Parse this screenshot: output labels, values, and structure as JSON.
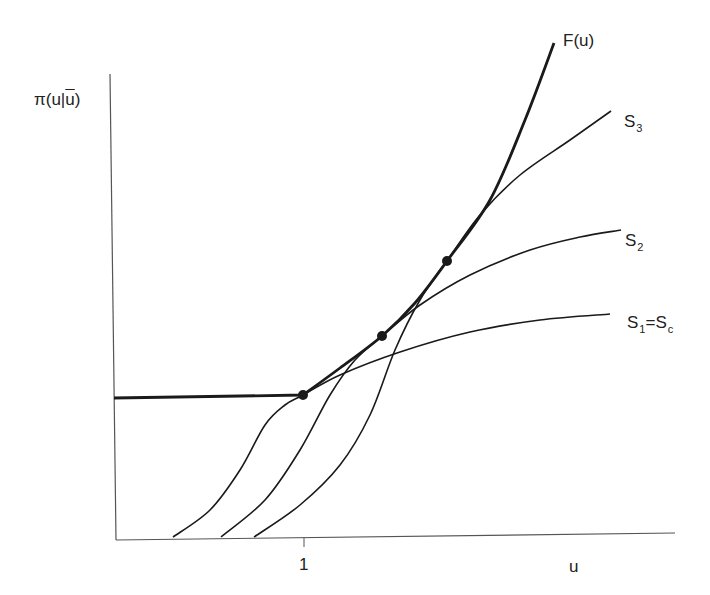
{
  "chart_data": {
    "type": "line",
    "title": "",
    "xlabel": "u",
    "ylabel": "π(u|ū)",
    "x_ticks": [
      {
        "value": 1,
        "label": "1"
      }
    ],
    "grid": false,
    "legend": "inline labels at curve ends",
    "series": [
      {
        "name": "F(u)",
        "label": "F(u)",
        "style": "thick",
        "description": "Upper envelope: flat segment for u<1, then convex increasing, tangent to S1, S2, S3 at marked points",
        "points": [
          [
            114,
            398
          ],
          [
            303,
            395
          ],
          [
            340,
            368
          ],
          [
            382,
            336
          ],
          [
            415,
            303
          ],
          [
            447,
            261
          ],
          [
            490,
            200
          ],
          [
            525,
            120
          ],
          [
            554,
            43
          ]
        ]
      },
      {
        "name": "S3",
        "label_main": "S",
        "label_sub": "3",
        "style": "thin",
        "description": "Sigmoid curve starting near u≈0.72, tangent to F at third point",
        "points": [
          [
            254,
            537
          ],
          [
            300,
            505
          ],
          [
            340,
            465
          ],
          [
            370,
            415
          ],
          [
            395,
            350
          ],
          [
            420,
            300
          ],
          [
            447,
            261
          ],
          [
            480,
            215
          ],
          [
            520,
            175
          ],
          [
            570,
            140
          ],
          [
            611,
            111
          ]
        ]
      },
      {
        "name": "S2",
        "label_main": "S",
        "label_sub": "2",
        "style": "thin",
        "description": "Sigmoid curve starting near u≈0.59, tangent to F at second point",
        "points": [
          [
            221,
            537
          ],
          [
            265,
            500
          ],
          [
            300,
            450
          ],
          [
            330,
            395
          ],
          [
            355,
            360
          ],
          [
            382,
            336
          ],
          [
            420,
            305
          ],
          [
            470,
            275
          ],
          [
            530,
            250
          ],
          [
            580,
            237
          ],
          [
            621,
            230
          ]
        ]
      },
      {
        "name": "S1 = Sc",
        "label_main": "S",
        "label_sub": "1",
        "label_suffix_main": "=S",
        "label_suffix_sub": "c",
        "style": "thin",
        "description": "Sigmoid curve starting near u≈0.31, tangent to F at first point (u=1)",
        "points": [
          [
            173,
            537
          ],
          [
            210,
            510
          ],
          [
            240,
            470
          ],
          [
            265,
            425
          ],
          [
            285,
            405
          ],
          [
            303,
            395
          ],
          [
            340,
            375
          ],
          [
            400,
            352
          ],
          [
            470,
            332
          ],
          [
            540,
            320
          ],
          [
            610,
            314
          ]
        ]
      }
    ],
    "tangent_points": [
      {
        "curve": "S1 = Sc",
        "u": 1,
        "px": [
          303,
          395
        ]
      },
      {
        "curve": "S2",
        "px": [
          382,
          336
        ]
      },
      {
        "curve": "S3",
        "px": [
          447,
          261
        ]
      }
    ],
    "axes": {
      "origin_px": [
        116,
        540
      ],
      "y_axis_top_px": [
        110,
        74
      ],
      "x_axis_end_px": [
        675,
        533
      ],
      "tick_1_px": [
        304,
        540
      ]
    }
  },
  "labels": {
    "y_axis": {
      "pi": "π",
      "open": "(u|",
      "ubar": "u",
      "close": ")"
    },
    "x_axis": "u",
    "tick_1": "1",
    "F": "F(u)",
    "S3": {
      "main": "S",
      "sub": "3"
    },
    "S2": {
      "main": "S",
      "sub": "2"
    },
    "S1": {
      "main": "S",
      "sub": "1",
      "eq": "=S",
      "sub2": "c"
    }
  },
  "colors": {
    "ink": "#1a1a1a",
    "axis": "#555555",
    "background": "#ffffff"
  }
}
